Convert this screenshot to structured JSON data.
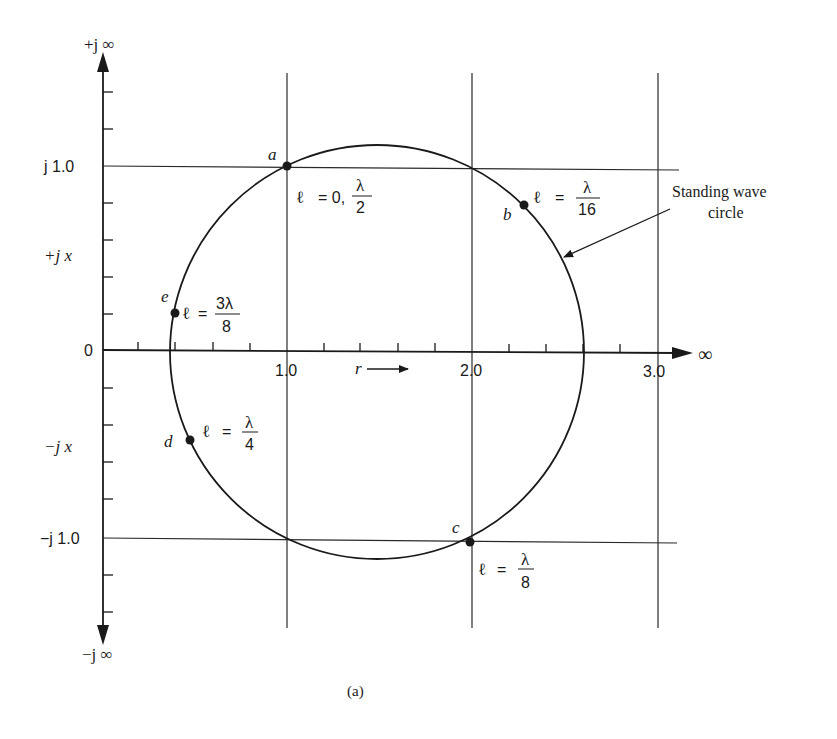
{
  "figure": {
    "caption": "(a)"
  },
  "axes": {
    "vertical": {
      "top_label": "+j ∞",
      "bottom_label": "−j ∞",
      "pos_label": "+j x",
      "neg_label": "−j x",
      "ticks": [
        {
          "label": "j 1.0",
          "value": 1.0
        },
        {
          "label": "0",
          "value": 0
        },
        {
          "label": "−j 1.0",
          "value": -1.0
        }
      ]
    },
    "horizontal": {
      "end_label": "∞",
      "axis_label": "r",
      "ticks": [
        {
          "label": "1.0",
          "value": 1.0
        },
        {
          "label": "2.0",
          "value": 2.0
        },
        {
          "label": "3.0",
          "value": 3.0
        }
      ]
    }
  },
  "annotation": {
    "line1": "Standing wave",
    "line2": "circle"
  },
  "points": [
    {
      "id": "a",
      "lhs": "ℓ",
      "eq": "= 0,",
      "num": "λ",
      "den": "2"
    },
    {
      "id": "b",
      "lhs": "ℓ",
      "eq": "=",
      "num": "λ",
      "den": "16"
    },
    {
      "id": "c",
      "lhs": "ℓ",
      "eq": "=",
      "num": "λ",
      "den": "8"
    },
    {
      "id": "d",
      "lhs": "ℓ",
      "eq": "=",
      "num": "λ",
      "den": "4"
    },
    {
      "id": "e",
      "lhs": "ℓ",
      "eq": "=",
      "num": "3λ",
      "den": "8"
    }
  ]
}
